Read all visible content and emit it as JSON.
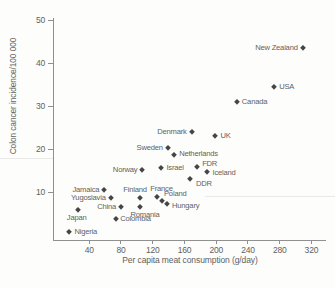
{
  "chart_data": {
    "type": "scatter",
    "title": "",
    "xlabel": "Per capita meat consumption (g/day)",
    "ylabel": "Colon cancer incidence/100 000",
    "x_ticks": [
      40,
      80,
      120,
      160,
      200,
      240,
      280,
      320
    ],
    "y_ticks": [
      10,
      20,
      30,
      40,
      50
    ],
    "xlim": [
      0,
      330
    ],
    "ylim": [
      0,
      50
    ],
    "grid": false,
    "legend": "none",
    "marker": "filled-diamond",
    "marker_color": "#454545",
    "axis_color": "#909090",
    "text_color": "#616161",
    "points": [
      {
        "country": "Nigeria",
        "meat": 15,
        "incidence": 0.6,
        "label_side": "right"
      },
      {
        "country": "Japan",
        "meat": 25.5,
        "incidence": 5.8,
        "label_side": "below",
        "dx": -1
      },
      {
        "country": "Jamaica",
        "meat": 59,
        "incidence": 10.5,
        "label_side": "left"
      },
      {
        "country": "Yugoslavia",
        "meat": 67,
        "incidence": 8.5,
        "label_side": "left"
      },
      {
        "country": "Colombia",
        "meat": 74,
        "incidence": 3.8,
        "label_side": "right",
        "dx": -1
      },
      {
        "country": "China",
        "meat": 80,
        "incidence": 6.4,
        "label_side": "left"
      },
      {
        "country": "Finland",
        "meat": 104,
        "incidence": 8.5,
        "label_side": "above",
        "dx": -5
      },
      {
        "country": "Romania",
        "meat": 104,
        "incidence": 6.6,
        "label_side": "below",
        "dx": 5
      },
      {
        "country": "Norway",
        "meat": 107,
        "incidence": 15.2,
        "label_side": "left"
      },
      {
        "country": "France",
        "meat": 126,
        "incidence": 8.8,
        "label_side": "above",
        "dx": 4
      },
      {
        "country": "Israel",
        "meat": 131,
        "incidence": 15.5,
        "label_side": "right"
      },
      {
        "country": "Poland",
        "meat": 132,
        "incidence": 8.0,
        "label_side": "above",
        "dx": 13,
        "dy": 1
      },
      {
        "country": "Hungary",
        "meat": 138,
        "incidence": 7.2,
        "label_side": "right",
        "dy": 2
      },
      {
        "country": "Sweden",
        "meat": 139,
        "incidence": 20.3,
        "label_side": "left"
      },
      {
        "country": "Netherlands",
        "meat": 147,
        "incidence": 18.6,
        "label_side": "right",
        "dy": -1
      },
      {
        "country": "DDR",
        "meat": 167,
        "incidence": 13.0,
        "label_side": "right",
        "dx": 1,
        "dy": 5
      },
      {
        "country": "Denmark",
        "meat": 169,
        "incidence": 24.0,
        "label_side": "left"
      },
      {
        "country": "FDR",
        "meat": 176,
        "incidence": 15.9,
        "label_side": "right",
        "dy": -3
      },
      {
        "country": "Iceland",
        "meat": 189,
        "incidence": 14.6,
        "label_side": "right",
        "dy": 1
      },
      {
        "country": "UK",
        "meat": 199,
        "incidence": 23.0,
        "label_side": "right"
      },
      {
        "country": "Canada",
        "meat": 226,
        "incidence": 31.0,
        "label_side": "right"
      },
      {
        "country": "USA",
        "meat": 273,
        "incidence": 34.5,
        "label_side": "right"
      },
      {
        "country": "New Zealand",
        "meat": 309,
        "incidence": 43.5,
        "label_side": "left"
      }
    ]
  }
}
